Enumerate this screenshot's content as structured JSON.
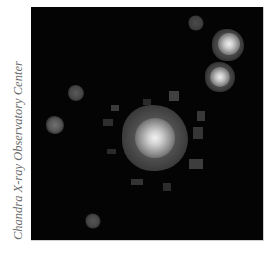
{
  "image": {
    "description": "X-ray image of a bright point source surrounded by several fainter sources",
    "credit": "Chandra X-ray Observatory Center",
    "background_color": "#040404"
  },
  "sources": [
    {
      "name": "central-bright-source",
      "x": 124,
      "y": 131,
      "core": 16,
      "halo": 62,
      "brightness": "bright"
    },
    {
      "name": "upper-right-source-a",
      "x": 197,
      "y": 38,
      "core": 10,
      "halo": 30,
      "brightness": "bright"
    },
    {
      "name": "upper-right-source-b",
      "x": 189,
      "y": 70,
      "core": 10,
      "halo": 28,
      "brightness": "bright"
    },
    {
      "name": "top-faint-source",
      "x": 165,
      "y": 16,
      "core": 0,
      "halo": 14,
      "brightness": "faint"
    },
    {
      "name": "left-faint-source-a",
      "x": 45,
      "y": 86,
      "core": 0,
      "halo": 15,
      "brightness": "faint"
    },
    {
      "name": "left-faint-source-b",
      "x": 24,
      "y": 118,
      "core": 0,
      "halo": 17,
      "brightness": "faint"
    },
    {
      "name": "bottom-faint-source",
      "x": 62,
      "y": 214,
      "core": 0,
      "halo": 14,
      "brightness": "faint"
    }
  ]
}
